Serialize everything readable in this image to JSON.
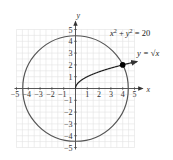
{
  "chart_data": {
    "type": "line",
    "title": "",
    "xlabel": "x",
    "ylabel": "y",
    "xlim": [
      -5,
      5
    ],
    "ylim": [
      -5,
      5
    ],
    "grid": true,
    "x_ticks": [
      -5,
      -4,
      -3,
      -2,
      -1,
      1,
      2,
      3,
      4,
      5
    ],
    "y_ticks": [
      -5,
      -4,
      -3,
      -2,
      -1,
      1,
      2,
      3,
      4,
      5
    ],
    "x_tick_labels": [
      "−5",
      "−4",
      "−3",
      "−2",
      "−1",
      "1",
      "2",
      "3",
      "4",
      "5"
    ],
    "y_tick_labels": [
      "−5",
      "−4",
      "−3",
      "−2",
      "−1",
      "1",
      "2",
      "3",
      "4",
      "5"
    ],
    "series": [
      {
        "name": "circle",
        "equation": "x² + y² = 20",
        "kind": "circle",
        "center": [
          0,
          0
        ],
        "radius_squared": 20,
        "color": "#555555"
      },
      {
        "name": "sqrt",
        "equation": "y = √x",
        "kind": "function",
        "domain": [
          0,
          5.2
        ],
        "color": "#222222",
        "arrow_end": true
      }
    ],
    "points": [
      {
        "label": "intersection",
        "x": 4,
        "y": 2,
        "color": "#000000"
      }
    ],
    "annotations": [
      {
        "id": "circle_eq",
        "parts": [
          "x",
          "2",
          " + ",
          "y",
          "2",
          " = 20"
        ]
      },
      {
        "id": "sqrt_eq",
        "text": "y = √x"
      }
    ]
  }
}
